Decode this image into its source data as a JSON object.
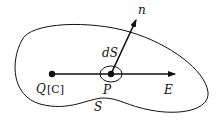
{
  "diagram": {
    "surface_label": "S",
    "charge_label": "Q",
    "charge_unit": "[C]",
    "point_label": "P",
    "normal_label": "n",
    "area_element_label": "dS",
    "field_label": "E",
    "colors": {
      "stroke": "#111111",
      "background": "#ffffff"
    }
  }
}
